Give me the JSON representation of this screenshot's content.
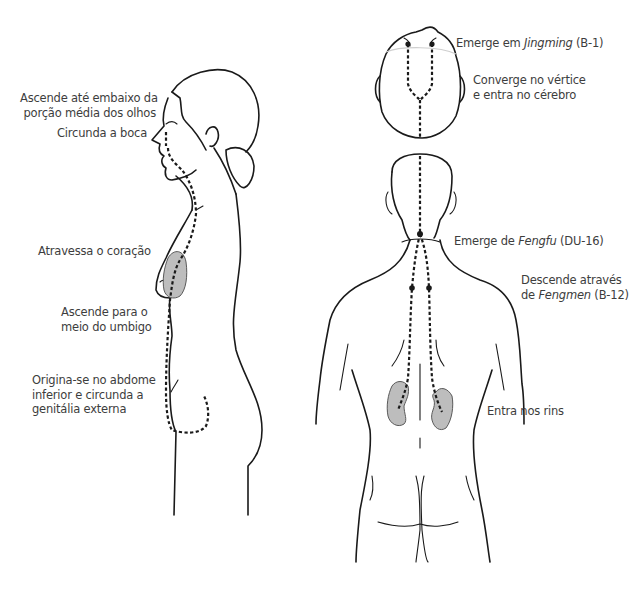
{
  "figure": {
    "colors": {
      "line": "#1a1a1a",
      "organ_fill": "#bdbdbd",
      "text": "#3d3d3d",
      "background": "#ffffff"
    }
  },
  "side_view": {
    "labels": [
      {
        "id": "eyes",
        "lines": [
          "Ascende até embaixo da",
          "porção média dos olhos"
        ]
      },
      {
        "id": "mouth",
        "lines": [
          "Circunda a boca"
        ]
      },
      {
        "id": "heart",
        "lines": [
          "Atravessa o coração"
        ]
      },
      {
        "id": "navel",
        "lines": [
          "Ascende para o",
          "meio do umbigo"
        ]
      },
      {
        "id": "origin",
        "lines": [
          "Origina-se no abdome",
          "inferior e circunda a",
          "genitália externa"
        ]
      }
    ]
  },
  "head_top_view": {
    "labels": [
      {
        "id": "jingming",
        "prefix": "Emerge em ",
        "italic": "Jingming",
        "suffix": " (B-1)"
      },
      {
        "id": "vertex",
        "lines": [
          "Converge no vértice",
          "e entra no cérebro"
        ]
      }
    ]
  },
  "back_view": {
    "labels": [
      {
        "id": "fengfu",
        "prefix": "Emerge de ",
        "italic": "Fengfu",
        "suffix": " (DU-16)"
      },
      {
        "id": "fengmen",
        "line1": "Descende através",
        "prefix": "de ",
        "italic": "Fengmen",
        "suffix": " (B-12)"
      },
      {
        "id": "kidneys",
        "lines": [
          "Entra nos rins"
        ]
      }
    ]
  }
}
